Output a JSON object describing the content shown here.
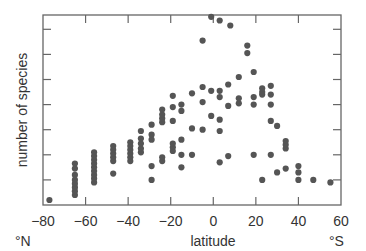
{
  "chart_data": {
    "type": "scatter",
    "title": "",
    "xlabel": "latitude",
    "ylabel": "number of species",
    "xlim": [
      -80,
      60
    ],
    "ylim": [
      0,
      7.5
    ],
    "x_ticks": [
      -80,
      -60,
      -40,
      -20,
      0,
      20,
      40,
      60
    ],
    "x_tick_labels": [
      "−80",
      "−60",
      "−40",
      "−20",
      "0",
      "20",
      "40",
      "60"
    ],
    "y_ticks": [
      1,
      2,
      3,
      4,
      5,
      6,
      7
    ],
    "y_tick_labels": [],
    "x_end_labels": {
      "left": "°N",
      "right": "°S"
    },
    "grid": false,
    "legend": null,
    "marker_color": "#555555",
    "series": [
      {
        "name": "species by latitude",
        "points": [
          [
            -77,
            0.2
          ],
          [
            -65,
            0.4
          ],
          [
            -65,
            0.55
          ],
          [
            -65,
            0.7
          ],
          [
            -65,
            0.85
          ],
          [
            -65,
            1.0
          ],
          [
            -65,
            1.2
          ],
          [
            -65,
            1.45
          ],
          [
            -65,
            1.65
          ],
          [
            -56,
            0.9
          ],
          [
            -56,
            1.05
          ],
          [
            -56,
            1.2
          ],
          [
            -56,
            1.35
          ],
          [
            -56,
            1.5
          ],
          [
            -56,
            1.65
          ],
          [
            -56,
            1.8
          ],
          [
            -56,
            1.95
          ],
          [
            -56,
            2.1
          ],
          [
            -47,
            1.25
          ],
          [
            -47,
            1.75
          ],
          [
            -47,
            1.9
          ],
          [
            -47,
            2.05
          ],
          [
            -47,
            2.2
          ],
          [
            -47,
            2.35
          ],
          [
            -39,
            1.75
          ],
          [
            -39,
            1.9
          ],
          [
            -39,
            2.05
          ],
          [
            -39,
            2.2
          ],
          [
            -39,
            2.35
          ],
          [
            -39,
            2.5
          ],
          [
            -34,
            2.1
          ],
          [
            -34,
            2.25
          ],
          [
            -34,
            2.45
          ],
          [
            -34,
            2.65
          ],
          [
            -34,
            2.95
          ],
          [
            -29,
            1.0
          ],
          [
            -29,
            1.55
          ],
          [
            -29,
            2.6
          ],
          [
            -29,
            2.8
          ],
          [
            -29,
            3.2
          ],
          [
            -24,
            1.75
          ],
          [
            -24,
            1.9
          ],
          [
            -24,
            3.3
          ],
          [
            -24,
            3.45
          ],
          [
            -24,
            3.6
          ],
          [
            -24,
            3.8
          ],
          [
            -19,
            2.15
          ],
          [
            -19,
            2.3
          ],
          [
            -19,
            2.45
          ],
          [
            -19,
            3.35
          ],
          [
            -19,
            3.9
          ],
          [
            -19,
            4.35
          ],
          [
            -15,
            1.5
          ],
          [
            -15,
            2.0
          ],
          [
            -15,
            2.6
          ],
          [
            -15,
            3.75
          ],
          [
            -15,
            4.0
          ],
          [
            -10,
            2.0
          ],
          [
            -10,
            3.05
          ],
          [
            -10,
            4.45
          ],
          [
            -5,
            3.0
          ],
          [
            -5,
            4.1
          ],
          [
            -5,
            4.7
          ],
          [
            -5,
            6.55
          ],
          [
            -1,
            3.55
          ],
          [
            -1,
            4.55
          ],
          [
            -1,
            7.5
          ],
          [
            3,
            1.7
          ],
          [
            3,
            2.95
          ],
          [
            3,
            3.4
          ],
          [
            3,
            4.3
          ],
          [
            3,
            4.55
          ],
          [
            3,
            7.35
          ],
          [
            7,
            1.95
          ],
          [
            7,
            3.95
          ],
          [
            7,
            4.8
          ],
          [
            8,
            7.15
          ],
          [
            12,
            4.05
          ],
          [
            12,
            4.25
          ],
          [
            12,
            5.1
          ],
          [
            16,
            6.35
          ],
          [
            16,
            6.05
          ],
          [
            19,
            2.0
          ],
          [
            19,
            4.0
          ],
          [
            19,
            4.3
          ],
          [
            19,
            5.3
          ],
          [
            23,
            1.0
          ],
          [
            23,
            4.4
          ],
          [
            23,
            4.5
          ],
          [
            23,
            4.65
          ],
          [
            27,
            2.0
          ],
          [
            27,
            3.35
          ],
          [
            27,
            4.0
          ],
          [
            27,
            4.4
          ],
          [
            27,
            4.75
          ],
          [
            30,
            1.3
          ],
          [
            30,
            3.15
          ],
          [
            34,
            1.45
          ],
          [
            34,
            2.25
          ],
          [
            34,
            2.4
          ],
          [
            34,
            2.55
          ],
          [
            40,
            1.0
          ],
          [
            40,
            1.3
          ],
          [
            40,
            1.55
          ],
          [
            47,
            1.0
          ],
          [
            55,
            0.9
          ]
        ]
      }
    ]
  }
}
